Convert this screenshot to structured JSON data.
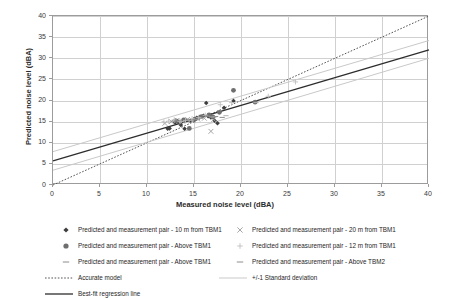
{
  "chart_data": {
    "type": "scatter",
    "title": "",
    "xlabel": "Measured noise level (dBA)",
    "ylabel": "Predicted noise level (dBA)",
    "xlim": [
      0,
      40
    ],
    "ylim": [
      0,
      40
    ],
    "xticks": [
      0,
      5,
      10,
      15,
      20,
      25,
      30,
      35,
      40
    ],
    "yticks": [
      0,
      5,
      10,
      15,
      20,
      25,
      30,
      35,
      40
    ],
    "grid": true,
    "legend_position": "bottom",
    "series": [
      {
        "name": "Predicted and measurement pair - 10 m from TBM1",
        "marker": "diamond",
        "color": "#3d3d3d",
        "points": [
          [
            12.2,
            13.3
          ],
          [
            12.4,
            13.4
          ],
          [
            13.0,
            14.8
          ],
          [
            13.3,
            15.0
          ],
          [
            13.6,
            14.2
          ],
          [
            14.0,
            13.3
          ],
          [
            14.2,
            15.4
          ],
          [
            14.6,
            15.2
          ],
          [
            15.0,
            15.3
          ],
          [
            15.3,
            15.9
          ],
          [
            15.6,
            16.1
          ],
          [
            16.0,
            16.4
          ],
          [
            16.3,
            19.4
          ],
          [
            16.5,
            16.3
          ],
          [
            16.8,
            16.0
          ],
          [
            17.2,
            15.2
          ],
          [
            17.5,
            14.6
          ],
          [
            18.2,
            18.3
          ],
          [
            19.2,
            19.9
          ]
        ]
      },
      {
        "name": "Predicted and measurement pair - 20 m from TBM1",
        "marker": "x",
        "color": "#a6a6a6",
        "points": [
          [
            11.9,
            14.6
          ],
          [
            12.6,
            15.0
          ],
          [
            13.2,
            15.3
          ],
          [
            13.8,
            15.1
          ],
          [
            14.3,
            15.5
          ],
          [
            14.9,
            15.2
          ],
          [
            15.4,
            15.6
          ],
          [
            16.1,
            15.8
          ],
          [
            16.8,
            12.7
          ],
          [
            17.1,
            15.5
          ]
        ]
      },
      {
        "name": "Predicted and measurement pair - Above TBM1",
        "marker": "circle",
        "color": "#6e6e6e",
        "points": [
          [
            13.1,
            15.2
          ],
          [
            13.9,
            15.4
          ],
          [
            14.5,
            13.4
          ],
          [
            15.1,
            15.6
          ],
          [
            15.8,
            16.2
          ],
          [
            16.6,
            16.6
          ],
          [
            17.0,
            16.1
          ],
          [
            17.7,
            17.2
          ],
          [
            19.2,
            22.4
          ],
          [
            21.5,
            19.6
          ]
        ]
      },
      {
        "name": "Predicted and measurement pair - 12 m from TBM1",
        "marker": "plus",
        "color": "#bfbfbf",
        "points": [
          [
            11.8,
            14.9
          ],
          [
            12.3,
            15.1
          ],
          [
            12.9,
            15.4
          ],
          [
            13.5,
            15.0
          ],
          [
            14.1,
            15.3
          ],
          [
            14.8,
            15.7
          ],
          [
            15.5,
            16.0
          ],
          [
            16.2,
            16.5
          ],
          [
            17.8,
            19.0
          ],
          [
            19.0,
            19.5
          ],
          [
            22.9,
            21.0
          ],
          [
            25.8,
            24.4
          ]
        ]
      },
      {
        "name": "Predicted and measurement pair - Above TBM1",
        "marker": "dash",
        "color": "#8c8c8c",
        "points": [
          [
            12.8,
            15.1
          ],
          [
            13.4,
            15.2
          ],
          [
            14.4,
            15.4
          ],
          [
            15.2,
            15.5
          ],
          [
            16.4,
            16.3
          ],
          [
            17.3,
            16.2
          ],
          [
            18.0,
            16.0
          ]
        ]
      },
      {
        "name": "Predicted and measurement pair - Above TBM2",
        "marker": "dash",
        "color": "#b0b0b0",
        "points": [
          [
            13.7,
            15.0
          ],
          [
            14.7,
            15.3
          ],
          [
            15.7,
            15.8
          ],
          [
            16.9,
            16.1
          ],
          [
            18.4,
            16.4
          ],
          [
            21.6,
            19.5
          ]
        ]
      }
    ],
    "lines": [
      {
        "name": "Accurate model",
        "style": "dotted",
        "color": "#555555",
        "from": [
          0,
          0
        ],
        "to": [
          40,
          40
        ]
      },
      {
        "name": "Best-fit regression line",
        "style": "solid",
        "color": "#2d2d2d",
        "from": [
          0,
          5.7
        ],
        "to": [
          40,
          32.0
        ]
      },
      {
        "name": "+/-1 Standard deviation (upper)",
        "style": "solid",
        "color": "#c9c9c9",
        "from": [
          0,
          7.9
        ],
        "to": [
          40,
          34.2
        ]
      },
      {
        "name": "+/-1 Standard deviation (lower)",
        "style": "solid",
        "color": "#c9c9c9",
        "from": [
          0,
          3.5
        ],
        "to": [
          40,
          30.0
        ]
      }
    ]
  },
  "axes": {
    "x_title": "Measured noise level (dBA)",
    "y_title": "Predicted noise level (dBA)",
    "x_tick_labels": [
      "0",
      "5",
      "10",
      "15",
      "20",
      "25",
      "30",
      "35",
      "40"
    ],
    "y_tick_labels": [
      "0",
      "5",
      "10",
      "15",
      "20",
      "25",
      "30",
      "35",
      "40"
    ]
  },
  "legend": {
    "column_a": [
      {
        "key": "diamond-marker",
        "label": "Predicted and measurement pair - 10 m from TBM1"
      },
      {
        "key": "circle-marker",
        "label": "Predicted and measurement pair - Above TBM1"
      },
      {
        "key": "dash-marker",
        "label": "Predicted and measurement pair - Above TBM1"
      }
    ],
    "column_b": [
      {
        "key": "x-marker",
        "label": "Predicted and measurement pair - 20 m from TBM1"
      },
      {
        "key": "plus-marker",
        "label": "Predicted and measurement pair - 12 m from TBM1"
      },
      {
        "key": "dash-marker",
        "label": "Predicted and measurement pair - Above TBM2"
      }
    ],
    "lines_a": [
      {
        "key": "dotted-line",
        "label": "Accurate model"
      },
      {
        "key": "solid-line",
        "label": "Best-fit regression line"
      }
    ],
    "lines_b": [
      {
        "key": "gray-line",
        "label": "+/-1 Standard deviation"
      }
    ]
  },
  "colors": {
    "grid": "#d0d0d0",
    "axis": "#9c9c9c",
    "regression": "#2d2d2d",
    "std_dev": "#c9c9c9",
    "accurate_model": "#555555",
    "text": "#262626"
  }
}
